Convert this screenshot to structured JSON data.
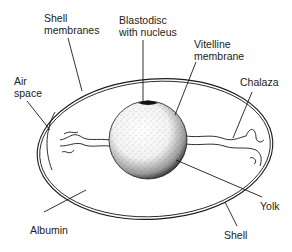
{
  "labels": {
    "shell_membranes": [
      "Shell",
      "membranes"
    ],
    "blastodisc": [
      "Blastodisc",
      "with nucleus"
    ],
    "vitelline": [
      "Vitelline",
      "membrane"
    ],
    "air_space": [
      "Air",
      "space"
    ],
    "chalaza": "Chalaza",
    "yolk": "Yolk",
    "albumin": "Albumin",
    "shell": "Shell"
  },
  "colors": {
    "line": "#1a1a1a",
    "background": "#ffffff",
    "text": "#222222"
  }
}
